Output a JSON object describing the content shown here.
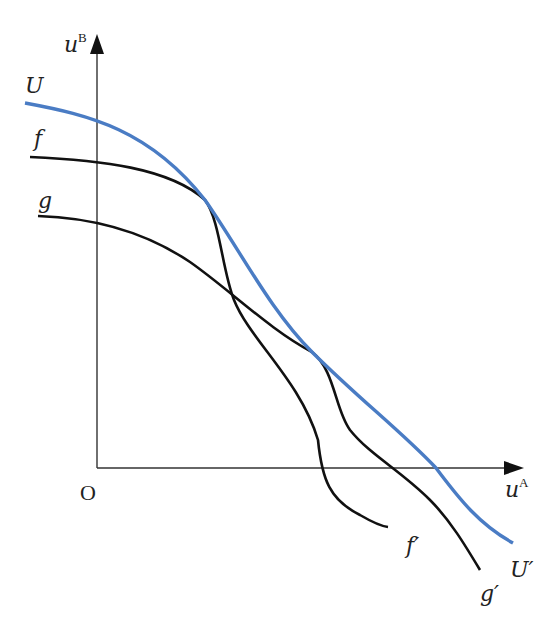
{
  "diagram": {
    "title": "",
    "axes": {
      "y_label": "u",
      "y_label_sup": "B",
      "x_label": "u",
      "x_label_sup": "A",
      "origin_label": "O"
    },
    "curves": [
      {
        "id": "U",
        "start_label": "U",
        "end_label": "U′",
        "color": "#4a7cc4"
      },
      {
        "id": "f",
        "start_label": "f",
        "end_label": "f′",
        "color": "#111111"
      },
      {
        "id": "g",
        "start_label": "g",
        "end_label": "g′",
        "color": "#111111"
      }
    ],
    "colors": {
      "envelope": "#4a7cc4",
      "curves": "#111111",
      "axes": "#333333",
      "background": "#ffffff"
    }
  }
}
